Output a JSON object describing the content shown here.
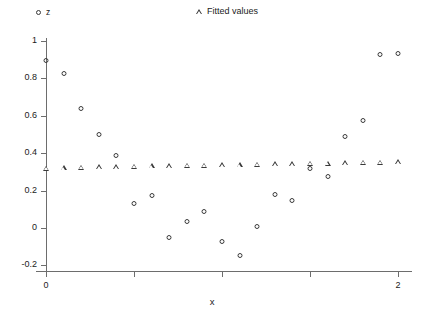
{
  "chart_data": {
    "type": "scatter",
    "title": "",
    "xlabel": "x",
    "ylabel": "",
    "xlim": [
      -0.06,
      2.12
    ],
    "ylim": [
      -0.27,
      1.06
    ],
    "grid": false,
    "legend_position": "top",
    "x_ticks": [
      0,
      0.5,
      1.0,
      1.5,
      2.0
    ],
    "x_tick_labels": [
      "0",
      "",
      "",
      "",
      "2"
    ],
    "y_ticks": [
      1,
      0.8,
      0.6,
      0.4,
      0.2,
      0,
      -0.2
    ],
    "y_tick_labels": [
      "1",
      "0.8",
      "0.6",
      "0.4",
      "0.2",
      "0",
      "-0.2"
    ],
    "x": [
      0,
      0.1,
      0.2,
      0.3,
      0.4,
      0.5,
      0.6,
      0.7,
      0.8,
      0.9,
      1.0,
      1.1,
      1.2,
      1.3,
      1.4,
      1.5,
      1.6,
      1.7,
      1.8,
      1.9,
      2.0
    ],
    "series": [
      {
        "name": "z",
        "marker": "circle",
        "color": "#3a3a3a",
        "values": [
          0.91,
          0.84,
          0.655,
          0.512,
          0.399,
          0.146,
          0.186,
          -0.04,
          0.049,
          0.104,
          -0.057,
          -0.135,
          0.022,
          0.195,
          0.163,
          0.329,
          0.291,
          0.502,
          0.586,
          0.942,
          0.948
        ]
      },
      {
        "name": "Fitted values",
        "marker": "triangle",
        "color": "#3a3a3a",
        "values": [
          0.338,
          0.341,
          0.343,
          0.345,
          0.347,
          0.349,
          0.351,
          0.352,
          0.354,
          0.355,
          0.357,
          0.358,
          0.36,
          0.361,
          0.363,
          0.364,
          0.366,
          0.367,
          0.369,
          0.37,
          0.372
        ]
      }
    ]
  },
  "legend": {
    "entries": [
      {
        "label": "z",
        "marker": "circle"
      },
      {
        "label": "Fitted values",
        "marker": "triangle"
      }
    ]
  },
  "axes": {
    "x_title": "x"
  }
}
